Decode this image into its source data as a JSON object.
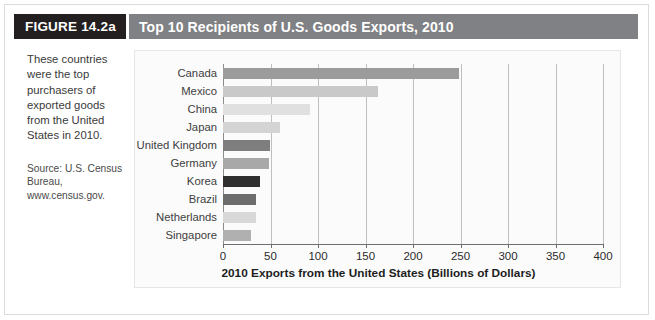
{
  "figure": {
    "tag": "FIGURE 14.2a",
    "title": "Top 10 Recipients of U.S. Goods Exports, 2010",
    "tag_bg": "#231f20",
    "title_bg": "#7f8184"
  },
  "caption": {
    "body": "These countries were the top purchasers of exported goods from the United States in 2010.",
    "source": "Source: U.S. Census Bureau, www.census.gov."
  },
  "chart_data": {
    "type": "bar",
    "orientation": "horizontal",
    "title": "Top 10 Recipients of U.S. Goods Exports, 2010",
    "xlabel": "2010 Exports from the United States (Billions of Dollars)",
    "ylabel": "",
    "xlim": [
      0,
      400
    ],
    "xticks": [
      0,
      50,
      100,
      150,
      200,
      250,
      300,
      350,
      400
    ],
    "grid": "vertical",
    "legend": "none",
    "categories": [
      "Canada",
      "Mexico",
      "China",
      "Japan",
      "United Kingdom",
      "Germany",
      "Korea",
      "Brazil",
      "Netherlands",
      "Singapore"
    ],
    "values": [
      248,
      163,
      92,
      60,
      49,
      48,
      39,
      35,
      35,
      29
    ],
    "bar_colors": [
      "#9b9b9b",
      "#c9c9c9",
      "#e0e0e0",
      "#d4d4d4",
      "#7e7e7e",
      "#a8a8a8",
      "#2f2f2f",
      "#6d6d6d",
      "#d8d8d8",
      "#b0b0b0"
    ],
    "gridline_color": "#bfbfbf",
    "axis_color": "#6e6e6e",
    "plot_bg": "#fbfbfb"
  }
}
